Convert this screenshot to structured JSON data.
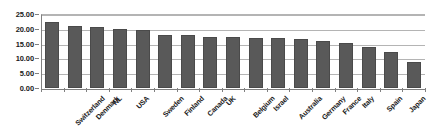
{
  "chart_data": {
    "type": "bar",
    "title": "",
    "subtitle": "",
    "xlabel": "",
    "ylabel": "",
    "ylim": [
      0,
      25
    ],
    "ytick_step": 5,
    "ytick_labels": [
      "25.00",
      "20.00",
      "15.00",
      "10.00",
      "5.00",
      "0.00"
    ],
    "ytick_values": [
      25,
      20,
      15,
      10,
      5,
      0
    ],
    "grid": true,
    "legend": "none",
    "bar_color": "#595959",
    "grid_color": "#b4b4b4",
    "axis_color": "#808080",
    "categories": [
      "Switzerland",
      "Denmark",
      "NL",
      "USA",
      "Sweden",
      "Finland",
      "Canada",
      "UK",
      "Belgium",
      "Israel",
      "Australia",
      "Germany",
      "France",
      "Italy",
      "Spain",
      "Japan",
      "China"
    ],
    "values": [
      22.2,
      20.8,
      20.6,
      20.1,
      19.7,
      17.9,
      17.8,
      17.4,
      17.3,
      17.0,
      16.9,
      16.6,
      15.8,
      15.2,
      14.0,
      12.3,
      8.7
    ]
  }
}
